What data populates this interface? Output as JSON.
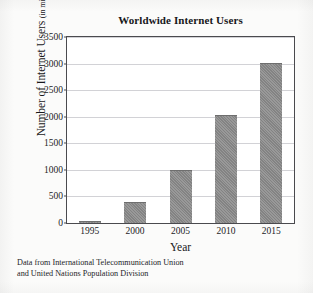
{
  "chart_data": {
    "type": "bar",
    "title": "Worldwide Internet Users",
    "xlabel": "Year",
    "ylabel": "Number of Internet Users",
    "ylabel_units": "(in millions)",
    "categories": [
      "1995",
      "2000",
      "2005",
      "2010",
      "2015"
    ],
    "values": [
      40,
      400,
      1000,
      2030,
      3020
    ],
    "ylim": [
      0,
      3500
    ],
    "yticks": [
      0,
      500,
      1000,
      1500,
      2000,
      2500,
      3000,
      3500
    ],
    "ytick_labels": [
      "0",
      "500",
      "1000",
      "1500",
      "2000",
      "2500",
      "3000",
      "3500"
    ],
    "grid": "horizontal",
    "legend": "none",
    "bar_color": "#8a8a8a",
    "frame_color": "#4a4a4e",
    "gridline_color": "#d2d2d6",
    "background_color": "#ffffff"
  },
  "source_note": {
    "line1": "Data from International Telecommunication Union",
    "line2": "and United Nations Population Division"
  }
}
